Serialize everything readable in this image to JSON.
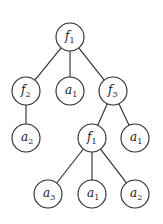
{
  "diagram": {
    "type": "tree",
    "node_radius": 14,
    "stroke_color": "#2a2a2a",
    "nodes": [
      {
        "id": "n0",
        "base": "f",
        "sub": "1",
        "x": 70,
        "y": 37
      },
      {
        "id": "n1",
        "base": "f",
        "sub": "2",
        "x": 26,
        "y": 91
      },
      {
        "id": "n2",
        "base": "a",
        "sub": "1",
        "x": 70,
        "y": 91
      },
      {
        "id": "n3",
        "base": "f",
        "sub": "3",
        "x": 113,
        "y": 91
      },
      {
        "id": "n4",
        "base": "a",
        "sub": "2",
        "x": 26,
        "y": 138
      },
      {
        "id": "n5",
        "base": "f",
        "sub": "1",
        "x": 92,
        "y": 138
      },
      {
        "id": "n6",
        "base": "a",
        "sub": "1",
        "x": 135,
        "y": 138
      },
      {
        "id": "n7",
        "base": "a",
        "sub": "3",
        "x": 48,
        "y": 194
      },
      {
        "id": "n8",
        "base": "a",
        "sub": "1",
        "x": 92,
        "y": 194
      },
      {
        "id": "n9",
        "base": "a",
        "sub": "2",
        "x": 135,
        "y": 194
      }
    ],
    "edges": [
      [
        "n0",
        "n1"
      ],
      [
        "n0",
        "n2"
      ],
      [
        "n0",
        "n3"
      ],
      [
        "n1",
        "n4"
      ],
      [
        "n3",
        "n5"
      ],
      [
        "n3",
        "n6"
      ],
      [
        "n5",
        "n7"
      ],
      [
        "n5",
        "n8"
      ],
      [
        "n5",
        "n9"
      ]
    ]
  }
}
